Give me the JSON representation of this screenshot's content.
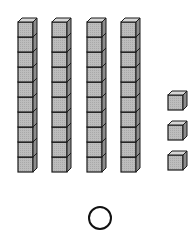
{
  "diagram": {
    "type": "base-ten-blocks",
    "tens_rods": {
      "count": 4,
      "cubes_per_rod": 10,
      "x_positions": [
        18,
        52,
        87,
        121
      ],
      "top_y": 18,
      "cube_size": 15
    },
    "units": {
      "count": 3,
      "x": 168,
      "y_positions": [
        91,
        121,
        151
      ],
      "cube_size": 15
    },
    "answer_bubble": {
      "cx": 100,
      "cy": 218,
      "r": 11
    },
    "colors": {
      "face": "#b8b8b8",
      "top": "#d6d6d6",
      "side": "#8c8c8c",
      "stroke": "#1a1a1a"
    }
  }
}
